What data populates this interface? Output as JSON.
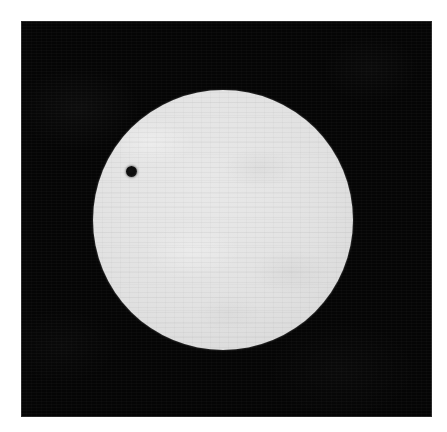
{
  "image": {
    "subject": "solar disk with transiting planet silhouette",
    "caption": "",
    "medium": "photograph",
    "orientation": "portrait",
    "width_px": 447,
    "height_px": 432
  },
  "canvas": {
    "background_color": "#ffffff",
    "margin_px": 21
  },
  "plate": {
    "name": "photographic plate",
    "background_color": "#050505",
    "left_px": 21,
    "top_px": 21,
    "width_px": 411,
    "height_px": 396
  },
  "sun": {
    "label": "Sun",
    "center_x_px": 223,
    "center_y_px": 220,
    "radius_px": 130,
    "disk_color": "#e2e2e2",
    "core_color": "#e8e8e8",
    "limb_color": "#c3c3c3",
    "limb_darkening": "slight",
    "surface_texture": "halftone dither / granulation mottling"
  },
  "transit": {
    "label": "transiting planet",
    "center_x_px": 131,
    "center_y_px": 171,
    "diameter_px": 11,
    "silhouette_color": "#0c0c0c",
    "position_on_disk": "upper left quadrant",
    "offset_from_center_px": 100
  },
  "icons": {
    "sun_disk": "sun-disk-icon",
    "planet_silhouette": "planet-silhouette-icon"
  }
}
